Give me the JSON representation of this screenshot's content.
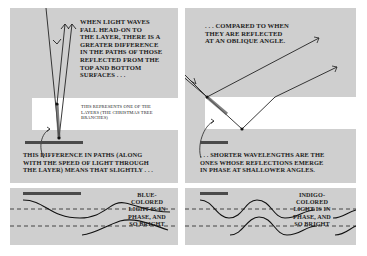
{
  "panels": {
    "top_left": {
      "caption": "When light waves fall head-on to the layer, there is a greater difference in the paths of those reflected from the top and bottom surfaces . . .",
      "caption_lines": [
        "WHEN LIGHT WAVES",
        "FALL HEAD-ON TO",
        "THE LAYER, THERE IS A",
        "GREATER DIFFERENCE",
        "IN THE PATHS OF THOSE",
        "REFLECTED FROM THE",
        "TOP AND BOTTOM",
        "SURFACES . . ."
      ],
      "layer_label_lines": [
        "THIS REPRESENTS ONE OF THE",
        "LAYERS (THE CHRISTMAS TREE",
        "BRANCHES)"
      ],
      "bottom_caption_lines": [
        "THIS DIFFERENCE IN PATHS (ALONG",
        "WITH THE SPEED OF LIGHT THROUGH",
        "THE LAYER) MEANS THAT SLIGHTLY . . ."
      ]
    },
    "top_right": {
      "caption_lines": [
        ". . . COMPARED TO WHEN",
        "THEY ARE REFLECTED",
        "AT AN OBLIQUE ANGLE."
      ],
      "bottom_caption_lines": [
        ". . . SHORTER WAVELENGTHS ARE THE",
        "ONES WHOSE REFLECTIONS EMERGE",
        "IN PHASE AT SHALLOWER ANGLES."
      ]
    },
    "bottom_left": {
      "wave_label_lines": [
        "BLUE-",
        "COLORED",
        "LIGHT IS IN",
        "PHASE, AND",
        "SO BRIGHT"
      ]
    },
    "bottom_right": {
      "wave_label_lines": [
        "INDIGO-",
        "COLORED",
        "LIGHT IS IN",
        "PHASE, AND",
        "SO BRIGHT"
      ]
    }
  },
  "colors": {
    "panel_bg": "#cfcfcf",
    "layer_bg": "#ffffff",
    "ink": "#1c1c1c",
    "path_bar": "#4a4a4a"
  }
}
